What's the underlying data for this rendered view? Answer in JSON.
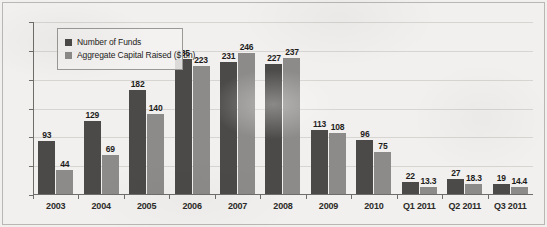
{
  "chart_data": {
    "type": "bar",
    "title": "",
    "xlabel": "",
    "ylabel": "",
    "ylim": [
      0,
      300
    ],
    "yticks": [
      0,
      50,
      100,
      150,
      200,
      250,
      300
    ],
    "grid": true,
    "legend_position": "top-left",
    "categories": [
      "2003",
      "2004",
      "2005",
      "2006",
      "2007",
      "2008",
      "2009",
      "2010",
      "Q1 2011",
      "Q2 2011",
      "Q3 2011"
    ],
    "series": [
      {
        "name": "Number of Funds",
        "color": "#4c4a49",
        "values": [
          93,
          129,
          182,
          235,
          231,
          227,
          113,
          96,
          22,
          27,
          19
        ],
        "labels": [
          "93",
          "129",
          "182",
          "235",
          "231",
          "227",
          "113",
          "96",
          "22",
          "27",
          "19"
        ]
      },
      {
        "name": "Aggregate Capital Raised ($ bn)",
        "color": "#8d8b89",
        "values": [
          44,
          69,
          140,
          223,
          246,
          237,
          108,
          75,
          13.3,
          18.3,
          14.4
        ],
        "labels": [
          "44",
          "69",
          "140",
          "223",
          "246",
          "237",
          "108",
          "75",
          "13.3",
          "18.3",
          "14.4"
        ]
      }
    ]
  },
  "legend": {
    "entries": [
      {
        "label": "Number of Funds"
      },
      {
        "label": "Aggregate Capital Raised ($ bn)"
      }
    ]
  }
}
